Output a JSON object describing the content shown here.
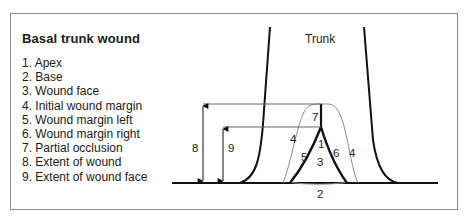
{
  "title": "Basal trunk wound",
  "legend": [
    {
      "num": "1.",
      "label": "Apex",
      "text": "1. Apex"
    },
    {
      "num": "2.",
      "label": "Base",
      "text": "2. Base"
    },
    {
      "num": "3.",
      "label": "Wound face",
      "text": "3. Wound face"
    },
    {
      "num": "4.",
      "label": "Initial wound margin",
      "text": "4. Initial wound margin"
    },
    {
      "num": "5.",
      "label": "Wound margin left",
      "text": "5. Wound margin left"
    },
    {
      "num": "6.",
      "label": "Wound margin right",
      "text": "6. Wound margin right"
    },
    {
      "num": "7.",
      "label": "Partial occlusion",
      "text": "7. Partial occlusion"
    },
    {
      "num": "8.",
      "label": "Extent of wound",
      "text": "8. Extent of wound"
    },
    {
      "num": "9.",
      "label": "Extent of wound face",
      "text": "9. Extent of wound face"
    }
  ],
  "diagram": {
    "trunk_label": "Trunk",
    "markers": {
      "apex": "1",
      "base": "2",
      "wound_face": "3",
      "initial_margin_left": "4",
      "initial_margin_right": "4",
      "margin_left": "5",
      "margin_right": "6",
      "partial_occlusion": "7",
      "extent_of_wound": "8",
      "extent_of_wound_face": "9"
    },
    "colors": {
      "bold_line": "#111111",
      "thin_line": "#8c8c8c",
      "frame": "#8a8a8a"
    }
  }
}
